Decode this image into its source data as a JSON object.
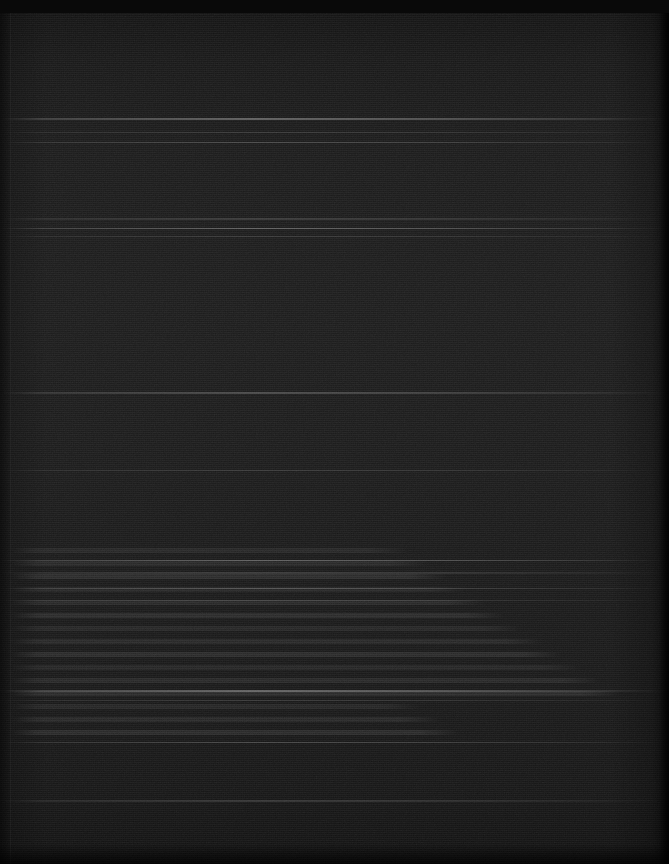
{
  "page": {
    "kind": "scanned-document-page",
    "width_px": 669,
    "height_px": 864,
    "orientation": "portrait",
    "legible_text": "",
    "visible_ui_controls": "",
    "description": "Severely underexposed near-black scan of a document page. No legible text, icons or interface controls are resolvable anywhere in the frame."
  },
  "appearance": {
    "base_color": "#141414",
    "darkest_color": "#090909",
    "lightest_color": "#1f1f1f",
    "top_edge_color": "#0d0d0d",
    "mid_page_color": "#1a1a1a",
    "bottom_edge_color": "#0c0c0c",
    "streak_highlight_color": "#2a2a2a"
  },
  "artifacts": {
    "scanline_period_px": 2,
    "scanline_direction": "horizontal",
    "column_noise_period_px": 2,
    "top_ragged_edge_height_px": 13,
    "left_seam_x_px": 10,
    "right_edge_width_px": 10,
    "bottom_shadow_height_px": 20,
    "streak_rows_px": [
      118,
      132,
      142,
      218,
      228,
      236,
      392,
      470,
      560,
      572,
      588,
      600,
      690,
      700,
      742,
      800
    ],
    "textline_band_range_px": [
      548,
      740
    ]
  }
}
